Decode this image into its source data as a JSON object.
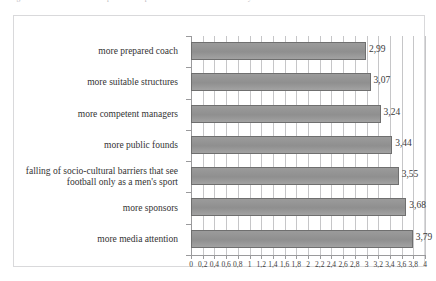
{
  "caption": {
    "text": "Figure 4. Factors that could help the development of women's football in Italy"
  },
  "chart_data": {
    "type": "bar",
    "orientation": "horizontal",
    "title": "",
    "xlabel": "",
    "ylabel": "",
    "xlim": [
      0,
      4
    ],
    "xtick_step": 0.2,
    "grid": true,
    "gridlines": "vertical",
    "legend": "none",
    "decimal_separator": ",",
    "bar_color": "#969696",
    "bar_edge_color": "#6f6f6f",
    "categories": [
      "more prepared coach",
      "more suitable structures",
      "more competent managers",
      "more public founds",
      "falling of socio-cultural barriers that see football only as a men's sport",
      "more sponsors",
      "more media attention"
    ],
    "values": [
      2.99,
      3.07,
      3.24,
      3.44,
      3.55,
      3.68,
      3.79
    ],
    "value_labels": [
      "2,99",
      "3,07",
      "3,24",
      "3,44",
      "3,55",
      "3,68",
      "3,79"
    ],
    "xtick_labels": [
      "0",
      "0,2",
      "0,4",
      "0,6",
      "0,8",
      "1",
      "1,2",
      "1,4",
      "1,6",
      "1,8",
      "2",
      "2,2",
      "2,4",
      "2,6",
      "2,8",
      "3",
      "3,2",
      "3,4",
      "3,6",
      "3,8",
      "4"
    ],
    "xtick_values": [
      0,
      0.2,
      0.4,
      0.6,
      0.8,
      1,
      1.2,
      1.4,
      1.6,
      1.8,
      2,
      2.2,
      2.4,
      2.6,
      2.8,
      3,
      3.2,
      3.4,
      3.6,
      3.8,
      4
    ]
  }
}
